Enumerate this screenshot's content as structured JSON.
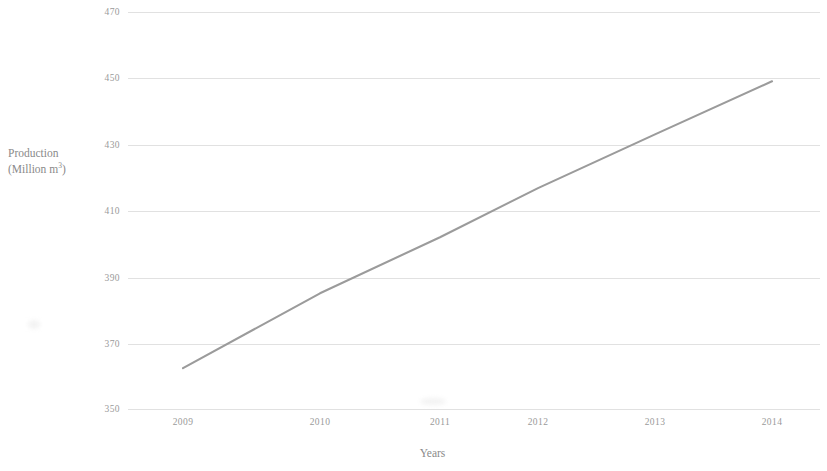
{
  "chart_data": {
    "type": "line",
    "title": "",
    "xlabel": "Years",
    "ylabel": "Production (Million m3)",
    "ylabel_line1": "Production",
    "ylabel_line2_prefix": "(Million m",
    "ylabel_line2_sup": "3",
    "ylabel_line2_suffix": ")",
    "categories": [
      "2009",
      "2010",
      "2011",
      "2012",
      "2013",
      "2014"
    ],
    "values": [
      362.6,
      385.2,
      402.1,
      416.9,
      433.1,
      449.1
    ],
    "series": [
      {
        "name": "Production",
        "values": [
          362.6,
          385.2,
          402.1,
          416.9,
          433.1,
          449.1
        ]
      }
    ],
    "ylim": [
      350,
      470
    ],
    "ytick_values": [
      470,
      450,
      430,
      410,
      390,
      370,
      350
    ],
    "ytick_labels": [
      "470",
      "450",
      "430",
      "410",
      "390",
      "370",
      "350"
    ],
    "xtick_labels": [
      "2009",
      "2010",
      "2011",
      "2012",
      "2013",
      "2014"
    ],
    "grid": "horizontal",
    "legend": "none",
    "line_color": "#9b9b9b",
    "grid_color": "#dcdcdc",
    "background_color": "#ffffff",
    "text_color": "#9a9a9a"
  }
}
